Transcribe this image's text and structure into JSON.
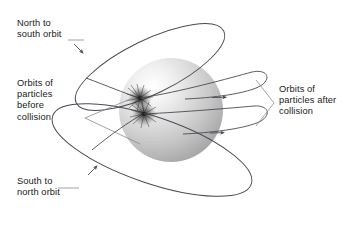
{
  "figure": {
    "background_color": "#ffffff",
    "width": 348,
    "height": 229
  },
  "labels": {
    "north_to_south": "North to\nsouth orbit",
    "orbits_before": "Orbits of\nparticles\nbefore\ncollision",
    "orbits_after": "Orbits of\nparticles after\ncollision",
    "south_to_north": "South to\nnorth orbit"
  },
  "colors": {
    "line": "#4a4a52",
    "leader": "#8a8a92",
    "text": "#1a1a1a",
    "sphere_highlight": "#fdfdfd",
    "sphere_mid": "#d2d2d2",
    "sphere_shadow": "#a8a8a8",
    "burst": "#2e2e2e"
  },
  "elements": {
    "planet": {
      "name": "planet-sphere",
      "center_x": 171,
      "center_y": 110,
      "radius": 52
    },
    "collision_points": [
      {
        "name": "collision-burst-upper",
        "x": 140,
        "y": 98
      },
      {
        "name": "collision-burst-lower",
        "x": 144,
        "y": 114
      }
    ],
    "orbits": [
      {
        "name": "north-to-south-orbit",
        "direction": "north to south"
      },
      {
        "name": "south-to-north-orbit",
        "direction": "south to north"
      }
    ],
    "outgoing_paths": [
      {
        "name": "post-collision-path-upper"
      },
      {
        "name": "post-collision-path-lower"
      }
    ],
    "brackets": [
      {
        "name": "bracket-before-collision",
        "vertex_x": 85,
        "vertex_y": 118
      },
      {
        "name": "bracket-after-collision",
        "vertex_x": 272,
        "vertex_y": 103
      }
    ]
  }
}
